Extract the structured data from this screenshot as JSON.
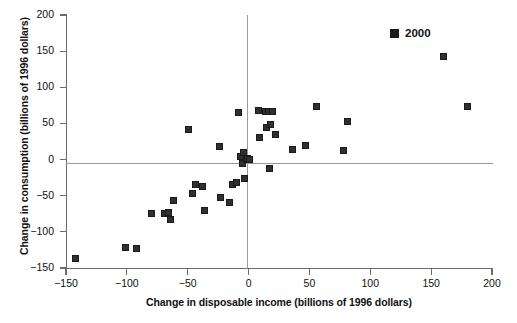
{
  "chart_data": {
    "type": "scatter",
    "title": "",
    "xlabel": "Change in disposable income (billions of 1996 dollars)",
    "ylabel": "Change in consumption (billions of 1996 dollars)",
    "xlim": [
      -150,
      200
    ],
    "ylim": [
      -150,
      200
    ],
    "xticks": [
      -150,
      -100,
      -50,
      0,
      50,
      100,
      150,
      200
    ],
    "xtick_labels": [
      "−150",
      "−100",
      "−50",
      "0",
      "50",
      "100",
      "150",
      "200"
    ],
    "yticks": [
      -150,
      -100,
      -50,
      0,
      50,
      100,
      150,
      200
    ],
    "ytick_labels": [
      "−150",
      "−100",
      "−50",
      "0",
      "50",
      "100",
      "150",
      "200"
    ],
    "grid": false,
    "zero_lines": true,
    "legend_position": "top-right",
    "marker_color": "#2f2f2f",
    "series": [
      {
        "name": "2000",
        "marker": "square",
        "color": "#2f2f2f",
        "points": [
          [
            -142,
            -137
          ],
          [
            -101,
            -121
          ],
          [
            -92,
            -123
          ],
          [
            -80,
            -74
          ],
          [
            -69,
            -74
          ],
          [
            -66,
            -73
          ],
          [
            -64,
            -83
          ],
          [
            -62,
            -57
          ],
          [
            -49,
            41
          ],
          [
            -46,
            -47
          ],
          [
            -44,
            -34
          ],
          [
            -38,
            -37
          ],
          [
            -36,
            -71
          ],
          [
            -24,
            18
          ],
          [
            -23,
            -53
          ],
          [
            -16,
            -60
          ],
          [
            -13,
            -35
          ],
          [
            -10,
            -32
          ],
          [
            -8,
            65
          ],
          [
            -7,
            4
          ],
          [
            -5,
            -6
          ],
          [
            -4,
            10
          ],
          [
            -3,
            -26
          ],
          [
            -2,
            0
          ],
          [
            -1,
            1
          ],
          [
            1,
            0
          ],
          [
            8,
            68
          ],
          [
            9,
            31
          ],
          [
            14,
            66
          ],
          [
            15,
            45
          ],
          [
            16,
            67
          ],
          [
            17,
            -13
          ],
          [
            18,
            48
          ],
          [
            20,
            67
          ],
          [
            22,
            34
          ],
          [
            36,
            14
          ],
          [
            47,
            20
          ],
          [
            56,
            74
          ],
          [
            78,
            12
          ],
          [
            81,
            53
          ],
          [
            160,
            143
          ],
          [
            180,
            74
          ]
        ]
      }
    ]
  },
  "legend": {
    "entries": [
      {
        "label": "2000",
        "color": "#2f2f2f"
      }
    ]
  }
}
